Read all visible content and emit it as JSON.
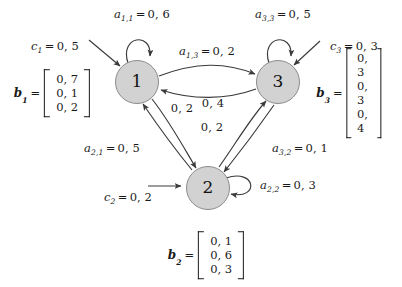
{
  "diagram": {
    "nodes": [
      {
        "id": "1",
        "label": "1",
        "cx": 137,
        "cy": 82
      },
      {
        "id": "3",
        "label": "3",
        "cx": 278,
        "cy": 82
      },
      {
        "id": "2",
        "label": "2",
        "cx": 208,
        "cy": 188
      }
    ],
    "self_loops": [
      {
        "node": "1",
        "label_var": "a",
        "label_sub": "1,1",
        "value": "0, 6",
        "label_x": 142,
        "label_y": 14
      },
      {
        "node": "3",
        "label_var": "a",
        "label_sub": "3,3",
        "value": "0, 5",
        "label_x": 283,
        "label_y": 14
      },
      {
        "node": "2",
        "label_var": "a",
        "label_sub": "2,2",
        "value": "0, 3",
        "label_x": 288,
        "label_y": 185
      }
    ],
    "edge_labels": [
      {
        "id": "a13",
        "var": "a",
        "sub": "1,3",
        "value": "0, 2",
        "x": 207,
        "y": 51
      },
      {
        "id": "mid-left",
        "var": "",
        "sub": "",
        "value": "0, 2",
        "x": 182,
        "y": 108
      },
      {
        "id": "mid-upper-right",
        "var": "",
        "sub": "",
        "value": "0, 4",
        "x": 213,
        "y": 103
      },
      {
        "id": "mid-lower",
        "var": "",
        "sub": "",
        "value": "0, 2",
        "x": 212,
        "y": 127
      },
      {
        "id": "a21",
        "var": "a",
        "sub": "2,1",
        "value": "0, 5",
        "x": 112,
        "y": 148
      },
      {
        "id": "a32",
        "var": "a",
        "sub": "3,2",
        "value": "0, 1",
        "x": 300,
        "y": 148
      }
    ],
    "input_labels": [
      {
        "id": "c1",
        "var": "c",
        "sub": "1",
        "value": "0, 5",
        "x": 55,
        "y": 46
      },
      {
        "id": "c3",
        "var": "c",
        "sub": "3",
        "value": "0, 3",
        "x": 354,
        "y": 46
      },
      {
        "id": "c2",
        "var": "c",
        "sub": "2",
        "value": "0, 2",
        "x": 128,
        "y": 197
      }
    ],
    "vectors": [
      {
        "id": "b1",
        "name": "b",
        "sub": "1",
        "eq": "=",
        "values": [
          "0, 7",
          "0, 1",
          "0, 2"
        ],
        "x": 52,
        "y": 93
      },
      {
        "id": "b3",
        "name": "b",
        "sub": "3",
        "eq": "=",
        "values": [
          "0, 3",
          "0, 3",
          "0, 4"
        ],
        "x": 349,
        "y": 93
      },
      {
        "id": "b2",
        "name": "b",
        "sub": "2",
        "eq": "=",
        "values": [
          "0, 1",
          "0, 6",
          "0, 3"
        ],
        "x": 206,
        "y": 255
      }
    ],
    "colors": {
      "node_fill": "#d2d2d2",
      "node_stroke": "#8c8c8c",
      "edge_stroke": "#3a3a3a",
      "text": "#1a1a1a",
      "background": "#ffffff"
    }
  }
}
